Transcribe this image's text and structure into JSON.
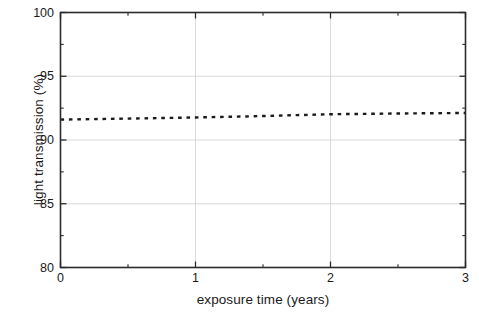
{
  "chart_data": {
    "type": "line",
    "title": "",
    "subtitle": "",
    "xlabel": "exposure time (years)",
    "ylabel": "light transmission (%)",
    "xlim": [
      0,
      3
    ],
    "ylim": [
      80,
      100
    ],
    "xticks": [
      0,
      1,
      2,
      3
    ],
    "xtick_labels": [
      "0",
      "1",
      "2",
      "3"
    ],
    "yticks": [
      80,
      85,
      90,
      95,
      100
    ],
    "ytick_labels": [
      "80",
      "85",
      "90",
      "95",
      "100"
    ],
    "x_minor_tick_step": 0.5,
    "y_minor_tick_step": 2.5,
    "grid": true,
    "grid_color": "#cfcfcf",
    "legend": null,
    "legend_position": "none",
    "annotations": [],
    "series": [
      {
        "name": "light transmission",
        "style": "dotted",
        "color": "#1a1a1a",
        "marker": "none",
        "linewidth": 2.4,
        "x": [
          0.0,
          0.25,
          0.5,
          0.75,
          1.0,
          1.25,
          1.5,
          1.75,
          2.0,
          2.25,
          2.5,
          2.75,
          3.0
        ],
        "values": [
          91.6,
          91.64,
          91.68,
          91.72,
          91.77,
          91.82,
          91.88,
          91.95,
          92.02,
          92.05,
          92.08,
          92.1,
          92.12
        ]
      }
    ]
  },
  "axes": {
    "frame_color": "#2b2b2b",
    "background": "#ffffff",
    "tick_color": "#2b2b2b"
  }
}
